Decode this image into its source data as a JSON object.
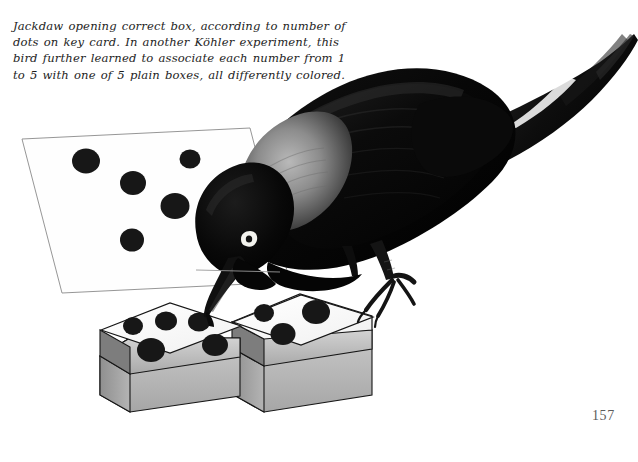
{
  "page": {
    "background_color": "#ffffff",
    "page_number": "157",
    "width": 638,
    "height": 462
  },
  "caption": {
    "full_text": "Jackdaw opening correct box, according to number of dots on key card. In another Köhler experiment, this bird further learned to associate each number from 1 to 5 with one of 5 plain boxes, all differently colored.",
    "lines": [
      "Jackdaw opening correct box, according to number of",
      "dots on key card. In another Köhler experiment, this",
      "bird further learned to associate each number from 1",
      "to 5 with one of 5 plain boxes, all differently colored."
    ],
    "text_color": "#1d1d1d",
    "style": "italic-serif"
  },
  "illustration": {
    "title": "jackdaw-opening-correct-box",
    "subject": "jackdaw-bird",
    "bird": {
      "name": "jackdaw",
      "body_color": "#0a0a0a",
      "nape_color": "#8e8e8e",
      "eye_color": "#f2f2ee",
      "eye_ring_color": "#1a1a1a",
      "beak_color": "#111111",
      "leg_color": "#141414",
      "pose": "leaning-down-over-boxes"
    },
    "key_card": {
      "label": "key-card",
      "dot_count": 5,
      "fill_color": "#fefefe",
      "outline_color": "#8a8a8a",
      "dot_color": "#161616"
    },
    "boxes": [
      {
        "label": "left-box",
        "dot_count": 5,
        "lid_color": "#fbfbfb",
        "side_color": "#c3c3c3",
        "front_color": "#b2b2b2",
        "outline_color": "#1a1a1a",
        "dot_color": "#161616",
        "state": "being-opened"
      },
      {
        "label": "right-box",
        "dot_count": 3,
        "lid_color": "#fbfbfb",
        "side_color": "#bdbdbd",
        "front_color": "#adadad",
        "outline_color": "#1a1a1a",
        "dot_color": "#161616",
        "state": "closed"
      }
    ],
    "table_surface_color": "#ffffff"
  }
}
